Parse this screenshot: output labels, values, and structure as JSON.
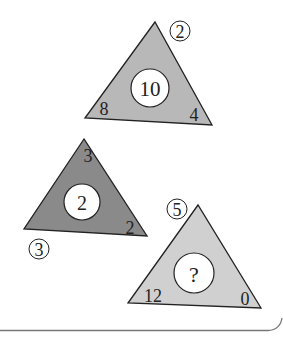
{
  "puzzle": {
    "triangles": [
      {
        "id": "top",
        "fill": "#b8b8b8",
        "center": "10",
        "top_corner_circled": "2",
        "bottom_left": "8",
        "bottom_right": "4"
      },
      {
        "id": "middle",
        "fill": "#8a8a8a",
        "center": "2",
        "top_corner": "3",
        "bottom_left_circled": "3",
        "bottom_right": "2"
      },
      {
        "id": "bottom",
        "fill": "#d0d0d0",
        "center": "?",
        "top_corner_circled": "5",
        "bottom_left": "12",
        "bottom_right": "0"
      }
    ]
  }
}
